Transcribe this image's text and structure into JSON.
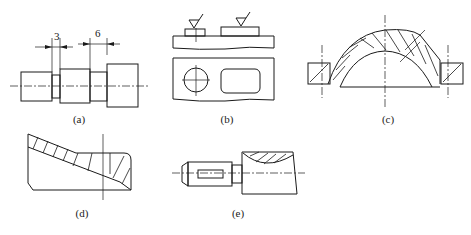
{
  "figure": {
    "panels": [
      {
        "id": "a",
        "caption": "(a)",
        "dimensions": [
          "3",
          "6"
        ],
        "description": "stepped shaft with undercut grooves dimensioned"
      },
      {
        "id": "b",
        "caption": "(b)",
        "description": "plate with raised pads and machining symbols, plan view with hole and slot"
      },
      {
        "id": "c",
        "caption": "(c)",
        "description": "sectioned dome-shaped part with flange holes"
      },
      {
        "id": "d",
        "caption": "(d)",
        "description": "sectioned part with sloped wall"
      },
      {
        "id": "e",
        "caption": "(e)",
        "description": "shaft with keyway and partial section"
      }
    ]
  },
  "colors": {
    "line": "#1a1a1a",
    "background": "#ffffff"
  }
}
